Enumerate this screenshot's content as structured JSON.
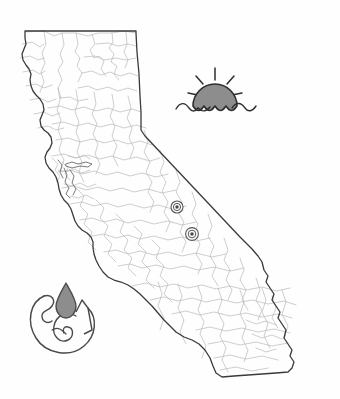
{
  "figure": {
    "title": "California state map illustration",
    "subject": "California",
    "background_color": "#fefefe",
    "width": 340,
    "height": 399
  },
  "map": {
    "name": "california-outline",
    "state_label": "California",
    "outline_color": "#3a3a3a",
    "outline_width": 1.3,
    "fill_color": "#ffffff",
    "county_border_color": "#b9b9b9",
    "county_border_width": 0.7,
    "description": "Outline of the state of California with interior county boundary lines"
  },
  "markers": [
    {
      "name": "location-marker-1",
      "style": "concentric-circle",
      "cx": 177,
      "cy": 207,
      "outer_radius": 6.0,
      "mid_radius": 3.6,
      "inner_radius": 1.7,
      "color": "#555555",
      "fill": "#ffffff"
    },
    {
      "name": "location-marker-2",
      "style": "concentric-circle",
      "cx": 192,
      "cy": 234,
      "outer_radius": 6.4,
      "mid_radius": 3.8,
      "inner_radius": 1.8,
      "color": "#555555",
      "fill": "#ffffff"
    }
  ],
  "sun_icon": {
    "name": "sun-over-water-icon",
    "label": "Sun over water",
    "fill_color": "#8d8d8d",
    "stroke_color": "#2e2e2e",
    "center_x": 215,
    "center_y": 98,
    "radius": 22,
    "ray_count": 5,
    "wave_count": 3
  },
  "drop_icon": {
    "name": "water-drop-swirl-icon",
    "label": "Water drop with swirl",
    "drop_fill_color": "#8d8d8d",
    "stroke_color": "#4a4a4a",
    "center_x": 64,
    "center_y": 322
  },
  "palette": {
    "ink": "#3a3a3a",
    "light_ink": "#b9b9b9",
    "gray_fill": "#8d8d8d",
    "paper": "#fefefe"
  }
}
